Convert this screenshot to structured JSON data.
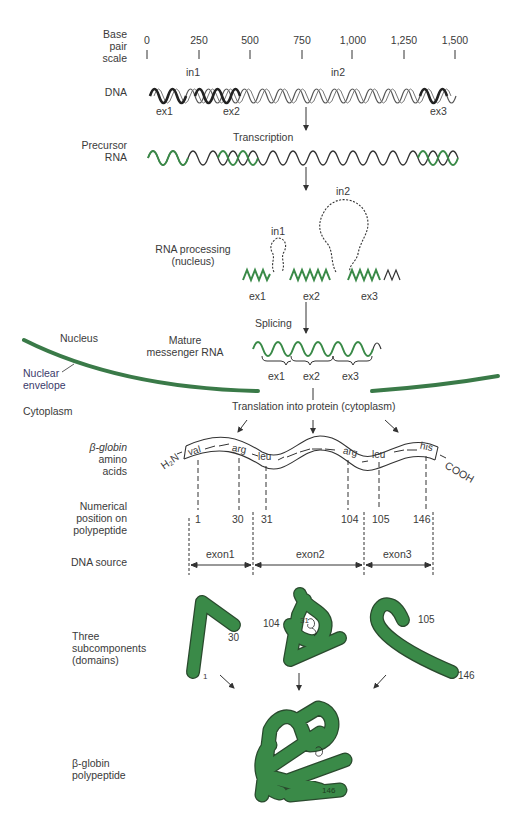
{
  "colors": {
    "green": "#3a8a48",
    "green_dark": "#2a5e32",
    "text": "#3a3a3a",
    "scale_start": "#b0524a",
    "scale_end": "#5a6a8a"
  },
  "scale": {
    "label": [
      "Base",
      "pair",
      "scale"
    ],
    "ticks": [
      "0",
      "250",
      "500",
      "750",
      "1,000",
      "1,250",
      "1,500"
    ],
    "introns": [
      "in1",
      "in2"
    ]
  },
  "dna": {
    "label": "DNA",
    "exons": [
      "ex1",
      "ex2",
      "ex3"
    ]
  },
  "transcription": {
    "label": "Transcription"
  },
  "precursor": {
    "label": [
      "Precursor",
      "RNA"
    ]
  },
  "processing": {
    "label": [
      "RNA processing",
      "(nucleus)"
    ],
    "introns": [
      "in1",
      "in2"
    ],
    "exons": [
      "ex1",
      "ex2",
      "ex3"
    ]
  },
  "splicing": {
    "label": "Splicing"
  },
  "mature": {
    "label": [
      "Mature",
      "messenger RNA"
    ],
    "exons": [
      "ex1",
      "ex2",
      "ex3"
    ]
  },
  "cell": {
    "nucleus": "Nucleus",
    "envelope": [
      "Nuclear",
      "envelope"
    ],
    "cytoplasm": "Cytoplasm"
  },
  "translation": {
    "label": "Translation into protein (cytoplasm)"
  },
  "amino": {
    "label": [
      "β-globin",
      "amino",
      "acids"
    ],
    "n_term": "H₂N",
    "c_term": "COOH",
    "residues": [
      "val",
      "arg",
      "leu",
      "arg",
      "leu",
      "his"
    ]
  },
  "position": {
    "label": [
      "Numerical",
      "position on",
      "polypeptide"
    ],
    "numbers": [
      "1",
      "30",
      "31",
      "104",
      "105",
      "146"
    ]
  },
  "source": {
    "label": "DNA source",
    "exons": [
      "exon1",
      "exon2",
      "exon3"
    ]
  },
  "domains": {
    "label": [
      "Three",
      "subcomponents",
      "(domains)"
    ],
    "numbers": [
      "1",
      "30",
      "104",
      "31",
      "105",
      "146"
    ]
  },
  "polypeptide": {
    "label": [
      "β-globin",
      "polypeptide"
    ],
    "number": "146"
  }
}
